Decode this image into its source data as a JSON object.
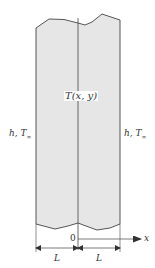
{
  "figure": {
    "type": "plane wall / slab cross-section",
    "colors": {
      "slab_fill": "#e6e6e6",
      "stroke": "#444444",
      "text": "#333333"
    },
    "labels": {
      "temperature_field": "T(x, y)",
      "left_boundary_h": "h, T",
      "left_boundary_sub": "∞",
      "right_boundary_h": "h, T",
      "right_boundary_sub": "∞",
      "origin": "0",
      "x_axis": "x",
      "left_half_width": "L",
      "right_half_width": "L"
    }
  }
}
